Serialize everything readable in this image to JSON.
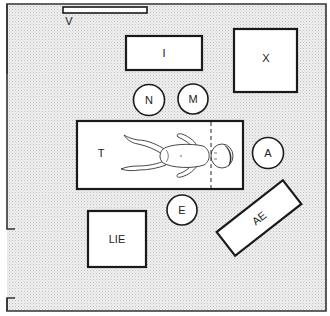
{
  "diagram": {
    "type": "room floor plan",
    "colors": {
      "floor": "#e6e6e6",
      "wall": "#333333",
      "fixture_fill": "#ffffff",
      "fixture_stroke": "#1a1a1a"
    },
    "labels": {
      "V": "V",
      "I": "I",
      "X": "X",
      "N": "N",
      "M": "M",
      "T": "T",
      "A": "A",
      "E": "E",
      "LIE": "LIE",
      "AE": "AE"
    },
    "elements": [
      {
        "id": "V",
        "shape": "bar",
        "position": "top wall"
      },
      {
        "id": "I",
        "shape": "rectangle"
      },
      {
        "id": "X",
        "shape": "square"
      },
      {
        "id": "N",
        "shape": "circle"
      },
      {
        "id": "M",
        "shape": "circle"
      },
      {
        "id": "T",
        "shape": "rectangle",
        "contents": "infant lying supine, head to right of dashed line"
      },
      {
        "id": "A",
        "shape": "circle"
      },
      {
        "id": "E",
        "shape": "circle"
      },
      {
        "id": "LIE",
        "shape": "square"
      },
      {
        "id": "AE",
        "shape": "rotated rectangle"
      }
    ],
    "door": {
      "wall": "left",
      "position": "lower left opening"
    }
  }
}
